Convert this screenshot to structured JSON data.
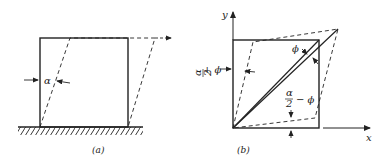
{
  "figure": {
    "panel_a": {
      "caption": "(a)",
      "angle_label": "α"
    },
    "panel_b": {
      "caption": "(b)",
      "y_axis_label": "y",
      "x_axis_label": "x",
      "phi_label": "ϕ",
      "left_label_num": "α",
      "left_label_den": "2",
      "left_label_rest": "+ ϕ",
      "bottom_label_num": "α",
      "bottom_label_den": "2",
      "bottom_label_rest": "− ϕ"
    },
    "colors": {
      "stroke": "#222222",
      "background": "#ffffff"
    }
  }
}
